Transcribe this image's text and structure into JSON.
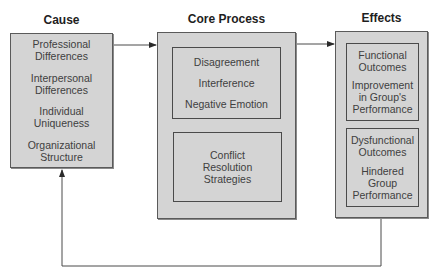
{
  "diagram": {
    "columns": {
      "cause": {
        "heading": "Cause",
        "items": [
          "Professional Differences",
          "Interpersonal Differences",
          "Individual Uniqueness",
          "Organizational Structure"
        ]
      },
      "core_process": {
        "heading": "Core Process",
        "top_group": [
          "Disagreement",
          "Interference",
          "Negative Emotion"
        ],
        "bottom_group": [
          "Conflict Resolution Strategies"
        ]
      },
      "effects": {
        "heading": "Effects",
        "functional": {
          "title": "Functional Outcomes",
          "detail": "Improvement in Group's Performance"
        },
        "dysfunctional": {
          "title": "Dysfunctional Outcomes",
          "detail": "Hindered Group Performance"
        }
      }
    },
    "connections": [
      {
        "from": "Cause",
        "to": "Core Process"
      },
      {
        "from": "Core Process",
        "to": "Effects"
      },
      {
        "from": "Effects",
        "to": "Cause",
        "type": "feedback-loop"
      }
    ],
    "colors": {
      "box_fill": "#d4d4d4",
      "box_border": "#5a5a5a",
      "line": "#4a4a4a",
      "text": "#404040"
    }
  }
}
